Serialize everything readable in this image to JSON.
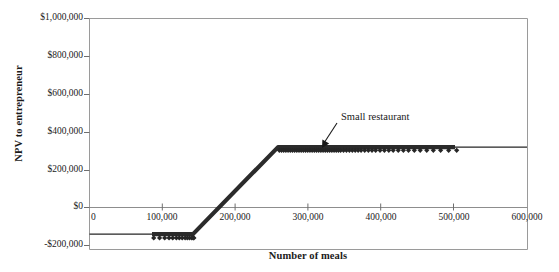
{
  "chart_data": {
    "type": "line",
    "title": "",
    "xlabel": "Number of meals",
    "ylabel": "NPV to entrepreneur",
    "xlim": [
      0,
      600000
    ],
    "ylim": [
      -200000,
      1000000
    ],
    "grid": false,
    "legend_position": "none",
    "x_ticks": [
      {
        "value": 0,
        "label": "0"
      },
      {
        "value": 100000,
        "label": "100,000"
      },
      {
        "value": 200000,
        "label": "200,000"
      },
      {
        "value": 300000,
        "label": "300,000"
      },
      {
        "value": 400000,
        "label": "400,000"
      },
      {
        "value": 500000,
        "label": "500,000"
      },
      {
        "value": 600000,
        "label": "600,000"
      }
    ],
    "y_ticks": [
      {
        "value": 1000000,
        "label": "$1,000,000"
      },
      {
        "value": 800000,
        "label": "$800,000"
      },
      {
        "value": 600000,
        "label": "$600,000"
      },
      {
        "value": 400000,
        "label": "$400,000"
      },
      {
        "value": 200000,
        "label": "$200,000"
      },
      {
        "value": 0,
        "label": "$0"
      },
      {
        "value": -200000,
        "label": "-$200,000"
      }
    ],
    "series": [
      {
        "name": "Small restaurant",
        "marker": "diamond",
        "color": "#262626",
        "description": "Piecewise NPV curve: flat at -$140,000 until capacity, rising linearly, then flat at $315,000",
        "points": [
          {
            "x": 0,
            "y": -140000
          },
          {
            "x": 88000,
            "y": -140000
          },
          {
            "x": 143000,
            "y": -140000
          },
          {
            "x": 260000,
            "y": 315000
          },
          {
            "x": 600000,
            "y": 315000
          }
        ],
        "scatter_x": [
          88000,
          96000,
          103000,
          109000,
          114000,
          119000,
          123000,
          127000,
          131000,
          134000,
          137000,
          140000,
          142000,
          143000,
          260000,
          263000,
          266000,
          269000,
          272000,
          275000,
          278000,
          281000,
          284000,
          287000,
          290000,
          293000,
          296000,
          299000,
          302000,
          305000,
          308000,
          311000,
          314000,
          317000,
          320000,
          323000,
          326000,
          329000,
          332000,
          335000,
          338000,
          341000,
          344000,
          348000,
          352000,
          356000,
          360000,
          364000,
          368000,
          372000,
          377000,
          382000,
          387000,
          392000,
          398000,
          404000,
          410000,
          416000,
          423000,
          430000,
          437000,
          445000,
          453000,
          462000,
          471000,
          481000,
          492000,
          503000
        ],
        "scatter_y_flat": -140000,
        "scatter_y_plateau": 315000
      }
    ],
    "annotations": [
      {
        "text": "Small restaurant",
        "x": 330000,
        "y": 430000,
        "arrow_to_x": 320000,
        "arrow_to_y": 320000
      }
    ],
    "colors": {
      "series": "#262626",
      "axis": "#888888",
      "text": "#1a1a1a",
      "background": "#ffffff"
    }
  }
}
